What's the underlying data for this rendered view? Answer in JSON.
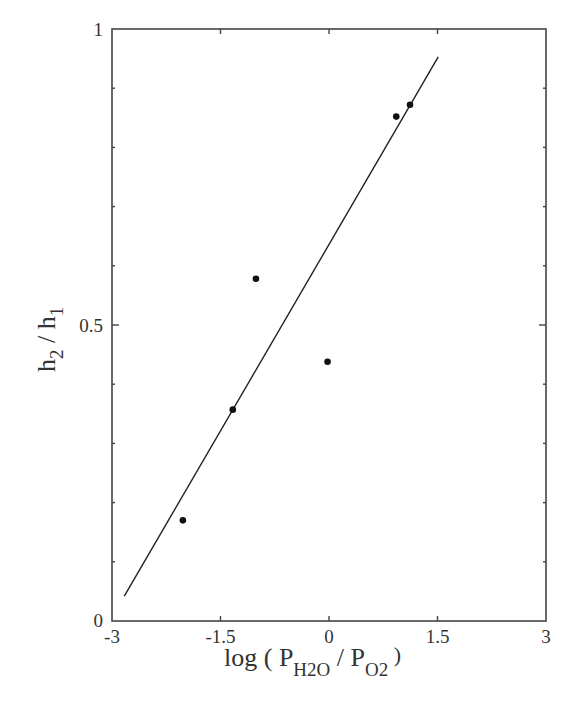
{
  "chart_data": {
    "type": "scatter",
    "title": "",
    "xlabel": "log ( P_H2O / P_O2 )",
    "ylabel": "h_2 / h_1",
    "xlim": [
      -3,
      3
    ],
    "ylim": [
      0,
      1
    ],
    "grid": false,
    "legend": null,
    "x_ticks": [
      -3,
      -1.5,
      0,
      1.5,
      3
    ],
    "x_tick_labels": [
      "-3",
      "-1.5",
      "0",
      "1.5",
      "3"
    ],
    "y_ticks": [
      0,
      0.5,
      1
    ],
    "y_tick_labels": [
      "0",
      "0.5",
      "1"
    ],
    "y_minor_step": 0.1,
    "series": [
      {
        "name": "measured",
        "kind": "scatter",
        "marker": "filled-circle",
        "color": "#111111",
        "points": [
          {
            "x": -2.02,
            "y": 0.17
          },
          {
            "x": -1.33,
            "y": 0.357
          },
          {
            "x": -1.01,
            "y": 0.578
          },
          {
            "x": -0.02,
            "y": 0.438
          },
          {
            "x": 0.93,
            "y": 0.852
          },
          {
            "x": 1.12,
            "y": 0.872
          }
        ]
      },
      {
        "name": "linear-fit",
        "kind": "line",
        "color": "#222222",
        "points": [
          {
            "x": -2.83,
            "y": 0.042
          },
          {
            "x": 1.51,
            "y": 0.953
          }
        ]
      }
    ]
  },
  "labels": {
    "x_title_prefix": "log ( P",
    "x_title_sub1": "H2O",
    "x_title_mid": " / P",
    "x_title_sub2": "O2",
    "x_title_suffix": " )",
    "y_title_h": "h",
    "y_title_sub1": "2",
    "y_title_mid": " / h",
    "y_title_sub2": "1"
  },
  "colors": {
    "frame": "#444444",
    "marker": "#111111",
    "line": "#222222",
    "text": "#333333"
  }
}
